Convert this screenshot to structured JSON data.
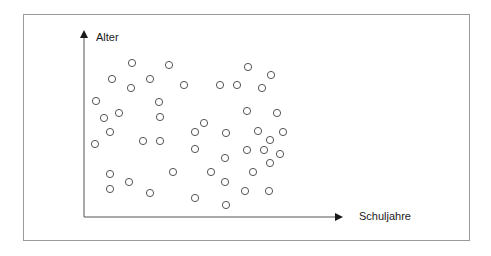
{
  "figure": {
    "y_axis_label": "Alter",
    "x_axis_label": "Schuljahre"
  },
  "colors": {
    "frame": "#9a9a9a",
    "axis": "#333333",
    "marker_stroke": "#555555",
    "text": "#1a1a1a"
  },
  "chart_data": {
    "type": "scatter",
    "title": "",
    "xlabel": "Schuljahre",
    "ylabel": "Alter",
    "grid": false,
    "legend": false,
    "ticks": false,
    "marker": "open-circle",
    "note": "Schematic scatter without numeric scales; point coordinates are pixel positions (x right, y down) within a 491x256 canvas, origin of axes at (84,217).",
    "axes_origin_px": [
      84,
      217
    ],
    "x_axis_end_px": [
      343,
      217
    ],
    "y_axis_end_px": [
      84,
      30
    ],
    "points_px": [
      [
        132,
        63
      ],
      [
        169,
        65
      ],
      [
        248,
        67
      ],
      [
        271,
        75
      ],
      [
        112,
        79
      ],
      [
        150,
        79
      ],
      [
        131,
        88
      ],
      [
        184,
        85
      ],
      [
        220,
        85
      ],
      [
        237,
        85
      ],
      [
        262,
        88
      ],
      [
        96,
        101
      ],
      [
        159,
        102
      ],
      [
        104,
        118
      ],
      [
        119,
        113
      ],
      [
        160,
        117
      ],
      [
        247,
        111
      ],
      [
        277,
        113
      ],
      [
        204,
        123
      ],
      [
        110,
        132
      ],
      [
        195,
        132
      ],
      [
        226,
        133
      ],
      [
        258,
        131
      ],
      [
        283,
        132
      ],
      [
        95,
        144
      ],
      [
        143,
        141
      ],
      [
        160,
        141
      ],
      [
        270,
        140
      ],
      [
        195,
        149
      ],
      [
        247,
        150
      ],
      [
        264,
        150
      ],
      [
        280,
        154
      ],
      [
        225,
        158
      ],
      [
        270,
        163
      ],
      [
        110,
        174
      ],
      [
        173,
        172
      ],
      [
        211,
        172
      ],
      [
        253,
        172
      ],
      [
        129,
        182
      ],
      [
        225,
        182
      ],
      [
        110,
        189
      ],
      [
        150,
        193
      ],
      [
        245,
        191
      ],
      [
        269,
        191
      ],
      [
        195,
        198
      ],
      [
        226,
        205
      ]
    ]
  }
}
